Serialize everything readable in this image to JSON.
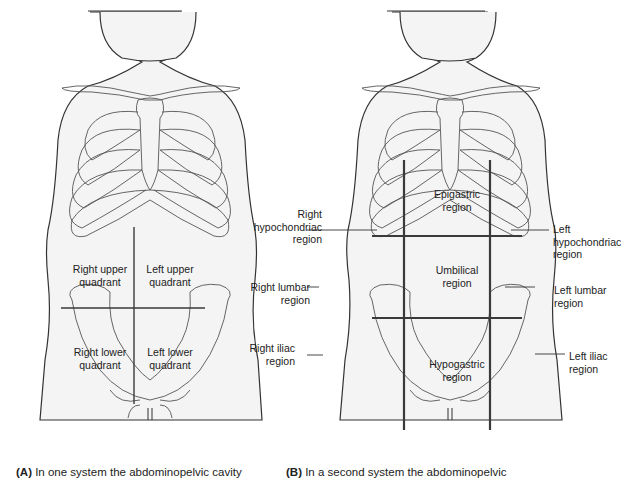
{
  "panel_a": {
    "caption_letter": "(A)",
    "caption_text": " In one system the abdominopelvic cavity",
    "labels": {
      "ruq_1": "Right upper",
      "ruq_2": "quadrant",
      "luq_1": "Left upper",
      "luq_2": "quadrant",
      "rlq_1": "Right lower",
      "rlq_2": "quadrant",
      "llq_1": "Left lower",
      "llq_2": "quadrant"
    }
  },
  "panel_b": {
    "caption_letter": "(B)",
    "caption_text": " In a second system the abdominopelvic",
    "labels": {
      "epigastric_1": "Epigastric",
      "epigastric_2": "region",
      "right_hypo_1": "Right",
      "right_hypo_2": "hypochondriac",
      "right_hypo_3": "region",
      "left_hypo_1": "Left",
      "left_hypo_2": "hypochondriac",
      "left_hypo_3": "region",
      "umbilical_1": "Umbilical",
      "umbilical_2": "region",
      "right_lumbar_1": "Right lumbar",
      "right_lumbar_2": "region",
      "left_lumbar_1": "Left lumbar",
      "left_lumbar_2": "region",
      "right_iliac_1": "Right iliac",
      "right_iliac_2": "region",
      "left_iliac_1": "Left iliac",
      "left_iliac_2": "region",
      "hypogastric_1": "Hypogastric",
      "hypogastric_2": "region"
    }
  },
  "colors": {
    "outline": "#333333",
    "skin": "#f4f4f4",
    "grid_line": "#3a3a3a",
    "bone": "#555555"
  }
}
